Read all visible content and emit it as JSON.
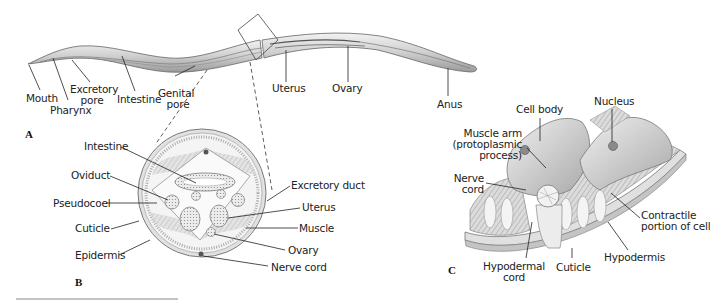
{
  "figure": {
    "panels": {
      "A": {
        "letter": "A",
        "title": "Whole worm, lateral view",
        "labels": {
          "mouth": "Mouth",
          "pharynx": "Pharynx",
          "excretory_pore_1": "Excretory",
          "excretory_pore_2": "pore",
          "intestine": "Intestine",
          "genital_pore_1": "Genital",
          "genital_pore_2": "pore",
          "uterus": "Uterus",
          "ovary": "Ovary",
          "anus": "Anus"
        }
      },
      "B": {
        "letter": "B",
        "title": "Cross section",
        "labels": {
          "intestine": "Intestine",
          "oviduct": "Oviduct",
          "pseudocoel": "Pseudocoel",
          "cuticle": "Cuticle",
          "epidermis": "Epidermis",
          "excretory_duct": "Excretory duct",
          "uterus": "Uterus",
          "muscle": "Muscle",
          "ovary": "Ovary",
          "nerve_cord": "Nerve cord"
        }
      },
      "C": {
        "letter": "C",
        "title": "Muscle cells, 3D view",
        "labels": {
          "cell_body": "Cell body",
          "nucleus": "Nucleus",
          "muscle_arm_1": "Muscle arm",
          "muscle_arm_2": "(protoplasmic",
          "muscle_arm_3": "process)",
          "nerve_cord_1": "Nerve",
          "nerve_cord_2": "cord",
          "contractile_1": "Contractile",
          "contractile_2": "portion of cell",
          "hypodermal_cord_1": "Hypodermal",
          "hypodermal_cord_2": "cord",
          "cuticle": "Cuticle",
          "hypodermis": "Hypodermis"
        }
      }
    },
    "colors": {
      "outline": "#555555",
      "fill_light": "#e6e6e6",
      "fill_mid": "#c8c8c8",
      "leader": "#222222"
    }
  }
}
